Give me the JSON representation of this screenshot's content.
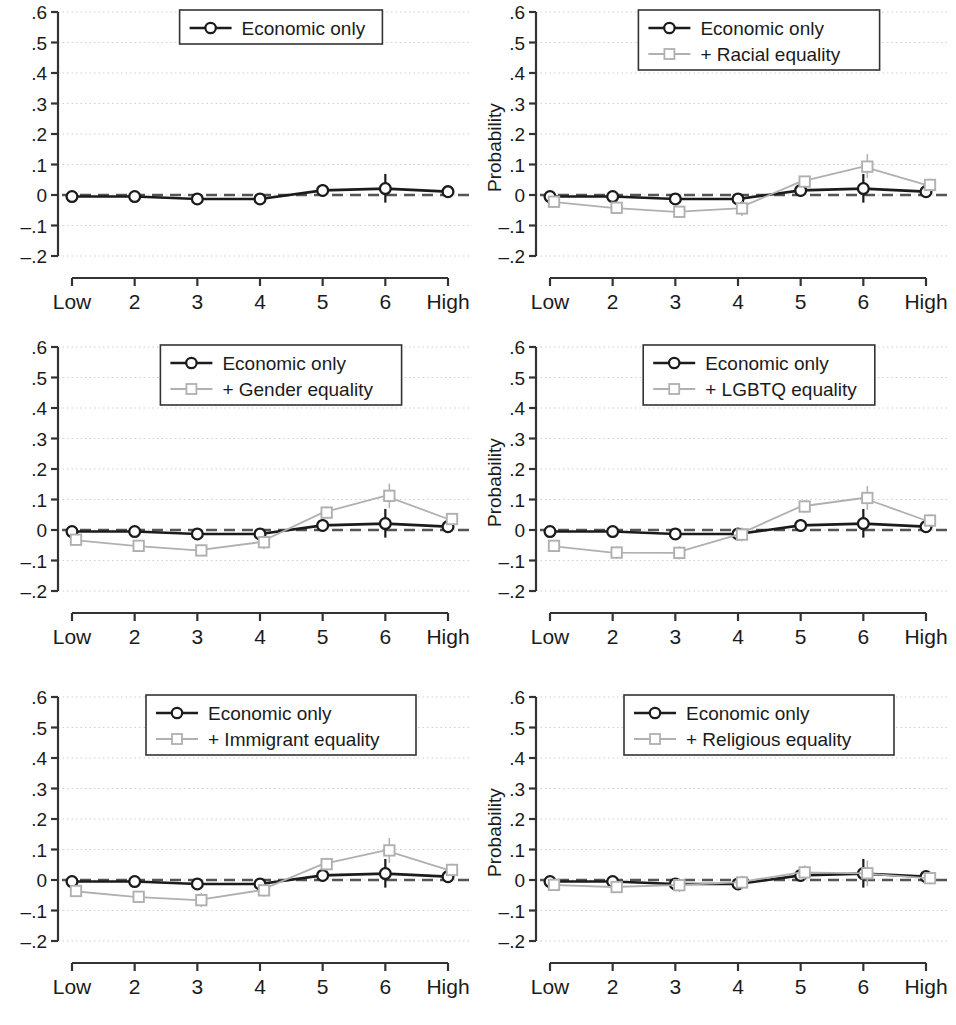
{
  "figure": {
    "panel_count": 6,
    "y_axis_label": "Probability",
    "y_ticks": [
      ".6",
      ".5",
      ".4",
      ".3",
      ".2",
      ".1",
      "0",
      "–.1",
      "–.2"
    ],
    "x_ticks": [
      "Low",
      "2",
      "3",
      "4",
      "5",
      "6",
      "High"
    ],
    "colors": {
      "economic": "#1b1b1b",
      "equality": "#b0b0b0",
      "grid": "#cfcfcf",
      "zero_line": "#555555",
      "axis": "#333333",
      "legend_border": "#333333"
    }
  },
  "chart_data": [
    {
      "id": "panel-economic-only",
      "type": "line",
      "title": "",
      "xlabel": "",
      "ylabel": "Probability",
      "categories": [
        "Low",
        "2",
        "3",
        "4",
        "5",
        "6",
        "High"
      ],
      "ylim": [
        -0.2,
        0.6
      ],
      "yticks": [
        -0.2,
        -0.1,
        0,
        0.1,
        0.2,
        0.3,
        0.4,
        0.5,
        0.6
      ],
      "grid": true,
      "legend_position": "top-center",
      "legend": [
        "Economic only"
      ],
      "series": [
        {
          "name": "Economic only",
          "marker": "circle",
          "color": "#1b1b1b",
          "values": [
            -0.005,
            -0.005,
            -0.013,
            -0.013,
            0.015,
            0.021,
            0.011
          ],
          "err_low": [
            -0.012,
            -0.017,
            -0.029,
            -0.028,
            -0.005,
            -0.025,
            0.001
          ],
          "err_high": [
            0.002,
            0.008,
            0.003,
            0.003,
            0.036,
            0.069,
            0.021
          ]
        }
      ]
    },
    {
      "id": "panel-racial-equality",
      "type": "line",
      "title": "",
      "xlabel": "",
      "ylabel": "Probability",
      "categories": [
        "Low",
        "2",
        "3",
        "4",
        "5",
        "6",
        "High"
      ],
      "ylim": [
        -0.2,
        0.6
      ],
      "yticks": [
        -0.2,
        -0.1,
        0,
        0.1,
        0.2,
        0.3,
        0.4,
        0.5,
        0.6
      ],
      "grid": true,
      "legend_position": "top-center",
      "legend": [
        "Economic only",
        "+ Racial equality"
      ],
      "series": [
        {
          "name": "Economic only",
          "marker": "circle",
          "color": "#1b1b1b",
          "values": [
            -0.005,
            -0.005,
            -0.013,
            -0.013,
            0.015,
            0.021,
            0.011
          ],
          "err_low": [
            -0.012,
            -0.017,
            -0.029,
            -0.028,
            -0.005,
            -0.025,
            0.001
          ],
          "err_high": [
            0.002,
            0.008,
            0.003,
            0.003,
            0.036,
            0.069,
            0.021
          ]
        },
        {
          "name": "+ Racial equality",
          "marker": "square",
          "color": "#b0b0b0",
          "values": [
            -0.022,
            -0.042,
            -0.055,
            -0.044,
            0.044,
            0.093,
            0.033
          ],
          "err_low": [
            -0.036,
            -0.06,
            -0.074,
            -0.069,
            0.026,
            0.055,
            0.012
          ],
          "err_high": [
            -0.008,
            -0.024,
            -0.036,
            -0.02,
            0.062,
            0.134,
            0.053
          ]
        }
      ]
    },
    {
      "id": "panel-gender-equality",
      "type": "line",
      "title": "",
      "xlabel": "",
      "ylabel": "Probability",
      "categories": [
        "Low",
        "2",
        "3",
        "4",
        "5",
        "6",
        "High"
      ],
      "ylim": [
        -0.2,
        0.6
      ],
      "yticks": [
        -0.2,
        -0.1,
        0,
        0.1,
        0.2,
        0.3,
        0.4,
        0.5,
        0.6
      ],
      "grid": true,
      "legend_position": "top-center",
      "legend": [
        "Economic only",
        "+ Gender equality"
      ],
      "series": [
        {
          "name": "Economic only",
          "marker": "circle",
          "color": "#1b1b1b",
          "values": [
            -0.005,
            -0.005,
            -0.013,
            -0.013,
            0.015,
            0.021,
            0.011
          ],
          "err_low": [
            -0.012,
            -0.017,
            -0.029,
            -0.028,
            -0.005,
            -0.025,
            0.001
          ],
          "err_high": [
            0.002,
            0.008,
            0.003,
            0.003,
            0.036,
            0.069,
            0.021
          ]
        },
        {
          "name": "+ Gender equality",
          "marker": "square",
          "color": "#b0b0b0",
          "values": [
            -0.032,
            -0.052,
            -0.067,
            -0.04,
            0.057,
            0.112,
            0.036
          ],
          "err_low": [
            -0.046,
            -0.07,
            -0.086,
            -0.062,
            0.037,
            0.072,
            0.017
          ],
          "err_high": [
            -0.018,
            -0.034,
            -0.048,
            -0.018,
            0.077,
            0.152,
            0.055
          ]
        }
      ]
    },
    {
      "id": "panel-lgbtq-equality",
      "type": "line",
      "title": "",
      "xlabel": "",
      "ylabel": "Probability",
      "categories": [
        "Low",
        "2",
        "3",
        "4",
        "5",
        "6",
        "High"
      ],
      "ylim": [
        -0.2,
        0.6
      ],
      "yticks": [
        -0.2,
        -0.1,
        0,
        0.1,
        0.2,
        0.3,
        0.4,
        0.5,
        0.6
      ],
      "grid": true,
      "legend_position": "top-center",
      "legend": [
        "Economic only",
        "+ LGBTQ equality"
      ],
      "series": [
        {
          "name": "Economic only",
          "marker": "circle",
          "color": "#1b1b1b",
          "values": [
            -0.005,
            -0.005,
            -0.013,
            -0.013,
            0.015,
            0.021,
            0.011
          ],
          "err_low": [
            -0.012,
            -0.017,
            -0.029,
            -0.028,
            -0.005,
            -0.025,
            0.001
          ],
          "err_high": [
            0.002,
            0.008,
            0.003,
            0.003,
            0.036,
            0.069,
            0.021
          ]
        },
        {
          "name": "+ LGBTQ equality",
          "marker": "square",
          "color": "#b0b0b0",
          "values": [
            -0.052,
            -0.074,
            -0.075,
            -0.015,
            0.077,
            0.105,
            0.031
          ],
          "err_low": [
            -0.068,
            -0.094,
            -0.096,
            -0.038,
            0.057,
            0.066,
            0.011
          ],
          "err_high": [
            -0.036,
            -0.054,
            -0.054,
            0.008,
            0.097,
            0.144,
            0.051
          ]
        }
      ]
    },
    {
      "id": "panel-immigrant-equality",
      "type": "line",
      "title": "",
      "xlabel": "",
      "ylabel": "Probability",
      "categories": [
        "Low",
        "2",
        "3",
        "4",
        "5",
        "6",
        "High"
      ],
      "ylim": [
        -0.2,
        0.6
      ],
      "yticks": [
        -0.2,
        -0.1,
        0,
        0.1,
        0.2,
        0.3,
        0.4,
        0.5,
        0.6
      ],
      "grid": true,
      "legend_position": "top-center",
      "legend": [
        "Economic only",
        "+ Immigrant equality"
      ],
      "series": [
        {
          "name": "Economic only",
          "marker": "circle",
          "color": "#1b1b1b",
          "values": [
            -0.005,
            -0.005,
            -0.013,
            -0.013,
            0.015,
            0.021,
            0.011
          ],
          "err_low": [
            -0.012,
            -0.017,
            -0.029,
            -0.028,
            -0.005,
            -0.025,
            0.001
          ],
          "err_high": [
            0.002,
            0.008,
            0.003,
            0.003,
            0.036,
            0.069,
            0.021
          ]
        },
        {
          "name": "+ Immigrant equality",
          "marker": "square",
          "color": "#b0b0b0",
          "values": [
            -0.036,
            -0.055,
            -0.066,
            -0.034,
            0.052,
            0.097,
            0.033
          ],
          "err_low": [
            -0.05,
            -0.074,
            -0.089,
            -0.055,
            0.031,
            0.056,
            0.013
          ],
          "err_high": [
            -0.022,
            -0.036,
            -0.043,
            -0.013,
            0.073,
            0.138,
            0.053
          ]
        }
      ]
    },
    {
      "id": "panel-religious-equality",
      "type": "line",
      "title": "",
      "xlabel": "",
      "ylabel": "Probability",
      "categories": [
        "Low",
        "2",
        "3",
        "4",
        "5",
        "6",
        "High"
      ],
      "ylim": [
        -0.2,
        0.6
      ],
      "yticks": [
        -0.2,
        -0.1,
        0,
        0.1,
        0.2,
        0.3,
        0.4,
        0.5,
        0.6
      ],
      "grid": true,
      "legend_position": "top-center",
      "legend": [
        "Economic only",
        "+ Religious equality"
      ],
      "series": [
        {
          "name": "Economic only",
          "marker": "circle",
          "color": "#1b1b1b",
          "values": [
            -0.005,
            -0.005,
            -0.013,
            -0.013,
            0.015,
            0.021,
            0.011
          ],
          "err_low": [
            -0.012,
            -0.017,
            -0.029,
            -0.028,
            -0.005,
            -0.025,
            0.001
          ],
          "err_high": [
            0.002,
            0.008,
            0.003,
            0.003,
            0.036,
            0.069,
            0.021
          ]
        },
        {
          "name": "+ Religious equality",
          "marker": "square",
          "color": "#b0b0b0",
          "values": [
            -0.016,
            -0.023,
            -0.017,
            -0.008,
            0.025,
            0.022,
            0.006
          ],
          "err_low": [
            -0.03,
            -0.041,
            -0.04,
            -0.03,
            0.002,
            -0.02,
            -0.014
          ],
          "err_high": [
            -0.002,
            -0.005,
            0.006,
            0.014,
            0.048,
            0.064,
            0.026
          ]
        }
      ]
    }
  ]
}
